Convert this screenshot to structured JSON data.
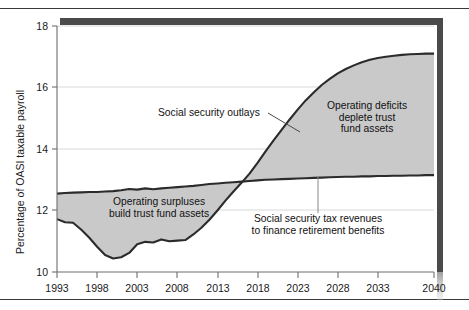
{
  "figure": {
    "name": "social-security-outlays-vs-revenues"
  },
  "chart_data": {
    "type": "area",
    "title": "",
    "xlabel": "",
    "ylabel": "Percentage of OASI taxable payroll",
    "xlim": [
      1993,
      2040
    ],
    "ylim": [
      10,
      18
    ],
    "grid": "horizontal-light",
    "legend": "none (inline annotations)",
    "yticks": [
      10,
      12,
      14,
      16,
      18
    ],
    "xticks": [
      1993,
      1998,
      2003,
      2008,
      2013,
      2018,
      2023,
      2028,
      2033,
      2040
    ],
    "x": [
      1993,
      1994,
      1995,
      1996,
      1997,
      1998,
      1999,
      2000,
      2001,
      2002,
      2003,
      2004,
      2005,
      2006,
      2007,
      2008,
      2009,
      2010,
      2011,
      2012,
      2013,
      2014,
      2015,
      2016,
      2017,
      2018,
      2019,
      2020,
      2021,
      2022,
      2023,
      2024,
      2025,
      2026,
      2027,
      2028,
      2029,
      2030,
      2031,
      2032,
      2033,
      2034,
      2035,
      2036,
      2037,
      2038,
      2039,
      2040
    ],
    "series": [
      {
        "name": "Social security outlays",
        "fill": "#c9c9c9",
        "line_color": "#2b2b2b",
        "values": [
          11.72,
          11.62,
          11.6,
          11.38,
          11.12,
          10.82,
          10.55,
          10.44,
          10.48,
          10.62,
          10.9,
          10.98,
          10.96,
          11.06,
          11.0,
          11.02,
          11.04,
          11.22,
          11.44,
          11.7,
          12.0,
          12.32,
          12.62,
          12.9,
          13.2,
          13.55,
          13.92,
          14.28,
          14.62,
          14.96,
          15.28,
          15.58,
          15.84,
          16.08,
          16.28,
          16.46,
          16.6,
          16.72,
          16.82,
          16.9,
          16.96,
          17.0,
          17.03,
          17.06,
          17.08,
          17.09,
          17.1,
          17.1
        ]
      },
      {
        "name": "Social security tax revenues",
        "line_color": "#2b2b2b",
        "values": [
          12.55,
          12.57,
          12.58,
          12.59,
          12.6,
          12.6,
          12.62,
          12.63,
          12.66,
          12.7,
          12.68,
          12.72,
          12.69,
          12.72,
          12.74,
          12.76,
          12.78,
          12.8,
          12.83,
          12.86,
          12.88,
          12.9,
          12.92,
          12.94,
          12.96,
          12.98,
          13.0,
          13.01,
          13.02,
          13.03,
          13.04,
          13.05,
          13.06,
          13.07,
          13.08,
          13.09,
          13.1,
          13.1,
          13.11,
          13.11,
          13.12,
          13.12,
          13.13,
          13.13,
          13.14,
          13.14,
          13.15,
          13.15
        ]
      }
    ],
    "annotations": [
      {
        "id": "social-security-outlays",
        "text": "Social security outlays",
        "leader": true
      },
      {
        "id": "operating-surpluses",
        "line1": "Operating surpluses",
        "line2": "build trust fund assets",
        "leader": false
      },
      {
        "id": "operating-deficits",
        "line1": "Operating deficits",
        "line2": "deplete trust",
        "line3": "fund assets",
        "leader": false
      },
      {
        "id": "tax-revenues",
        "line1": "Social security tax revenues",
        "line2": "to finance retirement benefits",
        "leader": true
      }
    ],
    "crossover_year": 2017,
    "colors": {
      "fill": "#c9c9c9",
      "line": "#2b2b2b",
      "axis": "#6e6e6e",
      "grid": "#d8d8d8",
      "shadow": "#4a4a4a"
    }
  },
  "axis": {
    "y_title": "Percentage of OASI taxable payroll",
    "y_ticks": [
      "18",
      "16",
      "14",
      "12",
      "10"
    ],
    "x_ticks": [
      "1993",
      "1998",
      "2003",
      "2008",
      "2013",
      "2018",
      "2023",
      "2028",
      "2033",
      "2040"
    ]
  },
  "labels": {
    "outlays": "Social security outlays",
    "surpluses_l1": "Operating surpluses",
    "surpluses_l2": "build trust fund assets",
    "deficits_l1": "Operating deficits",
    "deficits_l2": "deplete trust",
    "deficits_l3": "fund assets",
    "revenues_l1": "Social security tax revenues",
    "revenues_l2": "to finance retirement benefits"
  }
}
